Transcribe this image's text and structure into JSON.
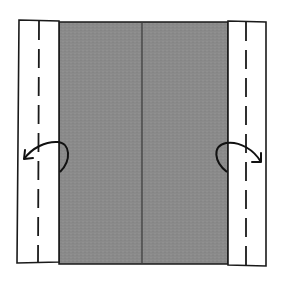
{
  "diagram": {
    "title": "",
    "colors": {
      "background": "#ffffff",
      "paper_colored": "#8a8a8a",
      "paper_white": "#ffffff",
      "line": "#1a1a1a",
      "center_crease": "#3a3a3a"
    },
    "panels": {
      "center": {
        "label": "colored-side",
        "x": 59,
        "y": 22,
        "w": 169,
        "h": 242
      },
      "left_strip": {
        "label": "white-flap-left",
        "x": 18,
        "y": 20,
        "w": 41,
        "h": 243
      },
      "right_strip": {
        "label": "white-flap-right",
        "x": 227,
        "y": 21,
        "w": 39,
        "h": 245
      }
    },
    "fold_lines": [
      {
        "name": "left-valley-fold",
        "x": 39,
        "style": "dashed"
      },
      {
        "name": "right-valley-fold",
        "x": 246,
        "style": "dashed"
      }
    ],
    "center_crease_x": 142,
    "arrows": [
      {
        "name": "fold-left-arrow",
        "direction": "left"
      },
      {
        "name": "fold-right-arrow",
        "direction": "right"
      }
    ]
  }
}
